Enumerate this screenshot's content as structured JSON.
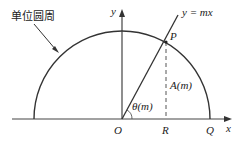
{
  "diagram": {
    "caption_label": "单位圆周",
    "axes": {
      "x_label": "x",
      "y_label": "y"
    },
    "line_label": "y = mx",
    "points": {
      "origin": "O",
      "P": "P",
      "R": "R",
      "Q": "Q"
    },
    "angle_label": "θ(m)",
    "area_label": "A(m)",
    "colors": {
      "stroke": "#222222",
      "background": "#ffffff"
    }
  }
}
